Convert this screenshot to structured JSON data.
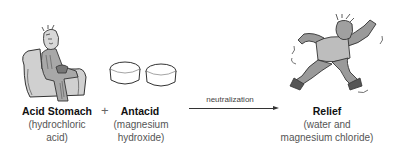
{
  "reactant_1": {
    "icon": "seated-man-holding-stomach-illustration",
    "name": "Acid Stomach",
    "detail_line_1": "(hydrochloric",
    "detail_line_2": "acid)"
  },
  "operator": "+",
  "reactant_2": {
    "icon": "antacid-tablets-illustration",
    "name": "Antacid",
    "detail_line_1": "(magnesium",
    "detail_line_2": "hydroxide)"
  },
  "reaction": {
    "label": "neutralization",
    "icon": "right-arrow"
  },
  "product": {
    "icon": "jumping-happy-man-illustration",
    "name": "Relief",
    "detail_line_1": "(water and",
    "detail_line_2": "magnesium chloride)"
  },
  "colors": {
    "ink": "#222222",
    "figure_fill": "#9a9a9a",
    "figure_light": "#d4d4d4",
    "text_muted": "#555555"
  }
}
